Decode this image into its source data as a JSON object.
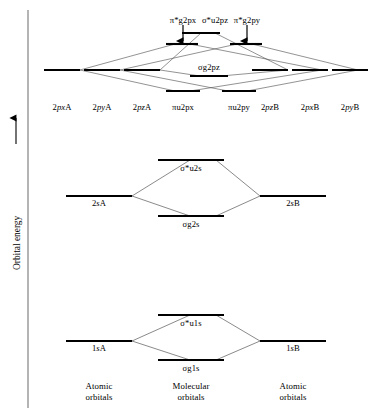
{
  "figure": {
    "type": "molecular-orbital-energy-level-diagram",
    "axis": {
      "label": "Orbital energy",
      "direction": "increasing-upward",
      "arrow": "up-arrow"
    },
    "columns": {
      "left": "Atomic orbitals",
      "center": "Molecular orbitals",
      "right": "Atomic orbitals"
    },
    "captions": [
      {
        "text_line1": "Atomic",
        "text_line2": "orbitals"
      },
      {
        "text_line1": "Molecular",
        "text_line2": "orbitals"
      },
      {
        "text_line1": "Atomic",
        "text_line2": "orbitals"
      }
    ]
  },
  "levels": {
    "atomic_2p_left": [
      {
        "id": "2pxA",
        "pre": "2",
        "ital": "px",
        "post": "A"
      },
      {
        "id": "2pyA",
        "pre": "2",
        "ital": "py",
        "post": "A"
      },
      {
        "id": "2pzA",
        "pre": "2",
        "ital": "pz",
        "post": "A"
      }
    ],
    "atomic_2p_right": [
      {
        "id": "2pzB",
        "pre": "2",
        "ital": "pz",
        "post": "B"
      },
      {
        "id": "2pxB",
        "pre": "2",
        "ital": "px",
        "post": "B"
      },
      {
        "id": "2pyB",
        "pre": "2",
        "ital": "py",
        "post": "B"
      }
    ],
    "molecular_2p_antibonding": [
      {
        "id": "pi-star-g-2px",
        "text": "π*g2px"
      },
      {
        "id": "sigma-star-u-2pz",
        "text": "σ*u2pz"
      },
      {
        "id": "pi-star-g-2py",
        "text": "π*g2py"
      }
    ],
    "molecular_2p_bonding": [
      {
        "id": "sigma-g-2pz",
        "text": "σg2pz"
      },
      {
        "id": "pi-u-2px",
        "text": "πu2px"
      },
      {
        "id": "pi-u-2py",
        "text": "πu2py"
      }
    ],
    "atomic_2s": [
      {
        "id": "2sA",
        "pre": "2",
        "ital": "s",
        "post": "A"
      },
      {
        "id": "2sB",
        "pre": "2",
        "ital": "s",
        "post": "B"
      }
    ],
    "molecular_2s": [
      {
        "id": "sigma-star-u-2s",
        "text": "σ*u2s"
      },
      {
        "id": "sigma-g-2s",
        "text": "σg2s"
      }
    ],
    "atomic_1s": [
      {
        "id": "1sA",
        "pre": "1",
        "ital": "s",
        "post": "A"
      },
      {
        "id": "1sB",
        "pre": "1",
        "ital": "s",
        "post": "B"
      }
    ],
    "molecular_1s": [
      {
        "id": "sigma-star-u-1s",
        "text": "σ*u1s"
      },
      {
        "id": "sigma-g-1s",
        "text": "σg1s"
      }
    ]
  },
  "colors": {
    "stroke": "#000000",
    "correlation_line": "#555555",
    "background": "#ffffff"
  }
}
